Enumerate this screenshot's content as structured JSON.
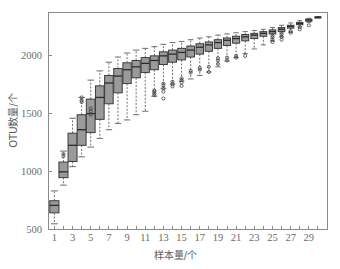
{
  "chart_data": {
    "type": "box",
    "title": "",
    "xlabel": "样本量/个",
    "ylabel": "OTU数量/个",
    "xlim": [
      0.3,
      31.0
    ],
    "ylim": [
      500,
      2380
    ],
    "grid": false,
    "legend": "none",
    "xticks_all": [
      1,
      2,
      3,
      4,
      5,
      6,
      7,
      8,
      9,
      10,
      11,
      12,
      13,
      14,
      15,
      16,
      17,
      18,
      19,
      20,
      21,
      22,
      23,
      24,
      25,
      26,
      27,
      28,
      29,
      30
    ],
    "xtick_labels": [
      "1",
      "3",
      "5",
      "7",
      "9",
      "11",
      "13",
      "15",
      "17",
      "19",
      "21",
      "23",
      "25",
      "27",
      "29"
    ],
    "xtick_label_values": [
      1,
      3,
      5,
      7,
      9,
      11,
      13,
      15,
      17,
      19,
      21,
      23,
      25,
      27,
      29
    ],
    "yticks": [
      500,
      1000,
      1500,
      2000
    ],
    "ytick_labels": [
      "500",
      "1000",
      "1500",
      "2000"
    ],
    "colors": {
      "box_fill": "#9a9a9a",
      "box_stroke": "#3c3c3c",
      "median": "#2b2b2b",
      "whisker": "#5f5f5f",
      "axis": "#8a8a8a",
      "tick_text": "#6b6b6b",
      "axis_title": "#5a5a5a",
      "background": "#ffffff"
    },
    "boxes": [
      {
        "x": 1,
        "whisker_low": 545,
        "q1": 640,
        "median": 705,
        "q3": 745,
        "whisker_high": 830,
        "outliers": []
      },
      {
        "x": 2,
        "whisker_low": 880,
        "q1": 945,
        "median": 995,
        "q3": 1080,
        "whisker_high": 1175,
        "outliers": [
          1130,
          1150
        ]
      },
      {
        "x": 3,
        "whisker_low": 1040,
        "q1": 1085,
        "median": 1225,
        "q3": 1330,
        "whisker_high": 1460,
        "outliers": []
      },
      {
        "x": 4,
        "whisker_low": 1125,
        "q1": 1225,
        "median": 1360,
        "q3": 1490,
        "whisker_high": 1640,
        "outliers": [
          1600,
          1615,
          1640
        ]
      },
      {
        "x": 5,
        "whisker_low": 1210,
        "q1": 1335,
        "median": 1500,
        "q3": 1625,
        "whisker_high": 1790,
        "outliers": [
          1490,
          1520,
          1545
        ]
      },
      {
        "x": 6,
        "whisker_low": 1285,
        "q1": 1450,
        "median": 1640,
        "q3": 1740,
        "whisker_high": 1870,
        "outliers": []
      },
      {
        "x": 7,
        "whisker_low": 1360,
        "q1": 1585,
        "median": 1765,
        "q3": 1830,
        "whisker_high": 1945,
        "outliers": []
      },
      {
        "x": 8,
        "whisker_low": 1415,
        "q1": 1680,
        "median": 1825,
        "q3": 1890,
        "whisker_high": 1990,
        "outliers": []
      },
      {
        "x": 9,
        "whisker_low": 1445,
        "q1": 1760,
        "median": 1880,
        "q3": 1940,
        "whisker_high": 2025,
        "outliers": []
      },
      {
        "x": 10,
        "whisker_low": 1490,
        "q1": 1810,
        "median": 1905,
        "q3": 1960,
        "whisker_high": 2050,
        "outliers": []
      },
      {
        "x": 11,
        "whisker_low": 1520,
        "q1": 1855,
        "median": 1935,
        "q3": 1985,
        "whisker_high": 2065,
        "outliers": []
      },
      {
        "x": 12,
        "whisker_low": 1650,
        "q1": 1880,
        "median": 1960,
        "q3": 2000,
        "whisker_high": 2080,
        "outliers": [
          1660,
          1675,
          1690,
          1700
        ]
      },
      {
        "x": 13,
        "whisker_low": 1715,
        "q1": 1925,
        "median": 2000,
        "q3": 2035,
        "whisker_high": 2100,
        "outliers": [
          1630,
          1690,
          1720,
          1745,
          1760
        ]
      },
      {
        "x": 14,
        "whisker_low": 1755,
        "q1": 1945,
        "median": 2015,
        "q3": 2050,
        "whisker_high": 2115,
        "outliers": [
          1735,
          1755,
          1775
        ]
      },
      {
        "x": 15,
        "whisker_low": 1780,
        "q1": 1965,
        "median": 2030,
        "q3": 2065,
        "whisker_high": 2125,
        "outliers": [
          1740,
          1770,
          1790,
          1805
        ]
      },
      {
        "x": 16,
        "whisker_low": 1800,
        "q1": 1990,
        "median": 2050,
        "q3": 2085,
        "whisker_high": 2140,
        "outliers": [
          1855,
          1870
        ]
      },
      {
        "x": 17,
        "whisker_low": 1830,
        "q1": 2015,
        "median": 2075,
        "q3": 2105,
        "whisker_high": 2155,
        "outliers": [
          1880,
          1895
        ]
      },
      {
        "x": 18,
        "whisker_low": 1860,
        "q1": 2040,
        "median": 2095,
        "q3": 2120,
        "whisker_high": 2165,
        "outliers": [
          1860,
          1905
        ]
      },
      {
        "x": 19,
        "whisker_low": 1905,
        "q1": 2065,
        "median": 2115,
        "q3": 2140,
        "whisker_high": 2180,
        "outliers": [
          1930,
          1960,
          1980
        ]
      },
      {
        "x": 20,
        "whisker_low": 1955,
        "q1": 2090,
        "median": 2135,
        "q3": 2155,
        "whisker_high": 2190,
        "outliers": [
          1960,
          1985
        ]
      },
      {
        "x": 21,
        "whisker_low": 1985,
        "q1": 2110,
        "median": 2150,
        "q3": 2170,
        "whisker_high": 2200,
        "outliers": [
          1985,
          2000
        ]
      },
      {
        "x": 22,
        "whisker_low": 2020,
        "q1": 2130,
        "median": 2165,
        "q3": 2185,
        "whisker_high": 2210,
        "outliers": [
          2000
        ]
      },
      {
        "x": 23,
        "whisker_low": 2060,
        "q1": 2150,
        "median": 2180,
        "q3": 2195,
        "whisker_high": 2220,
        "outliers": []
      },
      {
        "x": 24,
        "whisker_low": 2095,
        "q1": 2170,
        "median": 2195,
        "q3": 2210,
        "whisker_high": 2230,
        "outliers": []
      },
      {
        "x": 25,
        "whisker_low": 2130,
        "q1": 2190,
        "median": 2210,
        "q3": 2225,
        "whisker_high": 2245,
        "outliers": [
          2120,
          2140,
          2160,
          2175
        ]
      },
      {
        "x": 26,
        "whisker_low": 2165,
        "q1": 2210,
        "median": 2230,
        "q3": 2245,
        "whisker_high": 2265,
        "outliers": [
          2140,
          2165,
          2185,
          2200
        ]
      },
      {
        "x": 27,
        "whisker_low": 2205,
        "q1": 2240,
        "median": 2255,
        "q3": 2265,
        "whisker_high": 2285,
        "outliers": [
          2200,
          2215
        ]
      },
      {
        "x": 28,
        "whisker_low": 2250,
        "q1": 2270,
        "median": 2280,
        "q3": 2290,
        "whisker_high": 2305,
        "outliers": [
          2230,
          2250
        ]
      },
      {
        "x": 29,
        "whisker_low": 2290,
        "q1": 2300,
        "median": 2310,
        "q3": 2318,
        "whisker_high": 2325,
        "outliers": [
          2265
        ]
      },
      {
        "x": 30,
        "whisker_low": 2330,
        "q1": 2332,
        "median": 2335,
        "q3": 2338,
        "whisker_high": 2340,
        "outliers": []
      }
    ]
  },
  "plot": {
    "frame": {
      "left": 48,
      "top": 12,
      "right": 327,
      "bottom": 229
    }
  }
}
